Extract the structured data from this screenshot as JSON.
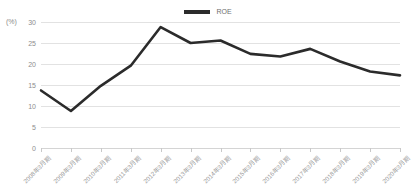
{
  "chart_data": {
    "type": "line",
    "title": "",
    "xlabel": "",
    "ylabel": "",
    "unit_label": "(%)",
    "ylim": [
      0,
      30
    ],
    "yticks": [
      0,
      5,
      10,
      15,
      20,
      25,
      30
    ],
    "grid": true,
    "legend_position": "top-center",
    "categories": [
      "2008年3月期",
      "2009年3月期",
      "2010年3月期",
      "2011年3月期",
      "2012年3月期",
      "2013年3月期",
      "2014年3月期",
      "2015年3月期",
      "2016年3月期",
      "2017年3月期",
      "2018年3月期",
      "2019年3月期",
      "2020年3月期"
    ],
    "series": [
      {
        "name": "ROE",
        "color": "#2b2b2b",
        "values": [
          13.7,
          8.8,
          14.8,
          19.6,
          28.8,
          25.0,
          25.6,
          22.4,
          21.8,
          23.6,
          20.6,
          18.2,
          17.3
        ]
      }
    ]
  },
  "legend": {
    "items": [
      {
        "label": "ROE",
        "color": "#2b2b2b"
      }
    ]
  },
  "colors": {
    "series": "#2b2b2b",
    "gridline": "#e2e2e2",
    "baseline": "#d4d4d4",
    "tick_text": "#8d8d8d",
    "label_text": "#9a9a9a",
    "background": "#ffffff"
  }
}
